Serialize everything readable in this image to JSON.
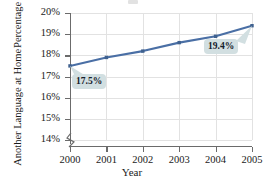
{
  "chart_data": {
    "type": "line",
    "title": "",
    "xlabel": "Year",
    "ylabel_line1": "Percentage Speaking",
    "ylabel_line2": "Another Language at Home",
    "categories": [
      "2000",
      "2001",
      "2002",
      "2003",
      "2004",
      "2005"
    ],
    "values": [
      17.5,
      17.9,
      18.2,
      18.6,
      18.9,
      19.4
    ],
    "ylim": [
      14,
      20
    ],
    "ytick_labels": [
      "20%",
      "19%",
      "18%",
      "17%",
      "16%",
      "15%",
      "14%"
    ],
    "ytick_values": [
      20,
      19,
      18,
      17,
      16,
      15,
      14
    ],
    "xtick_labels": [
      "2000",
      "2001",
      "2002",
      "2003",
      "2004",
      "2005"
    ],
    "grid": true,
    "legend": "none",
    "axis_break": true,
    "annotations": [
      {
        "name": "first-point-callout",
        "label": "17.5%",
        "points_to": "2000"
      },
      {
        "name": "last-point-callout",
        "label": "19.4%",
        "points_to": "2005"
      }
    ],
    "colors": {
      "series_line": "#4a6fa5",
      "marker": "#3f618f",
      "gridline": "#e2e2e2",
      "axis": "#6b6b6b",
      "callout_bg": "#d2dfe1",
      "text": "#1a1a1a"
    }
  }
}
